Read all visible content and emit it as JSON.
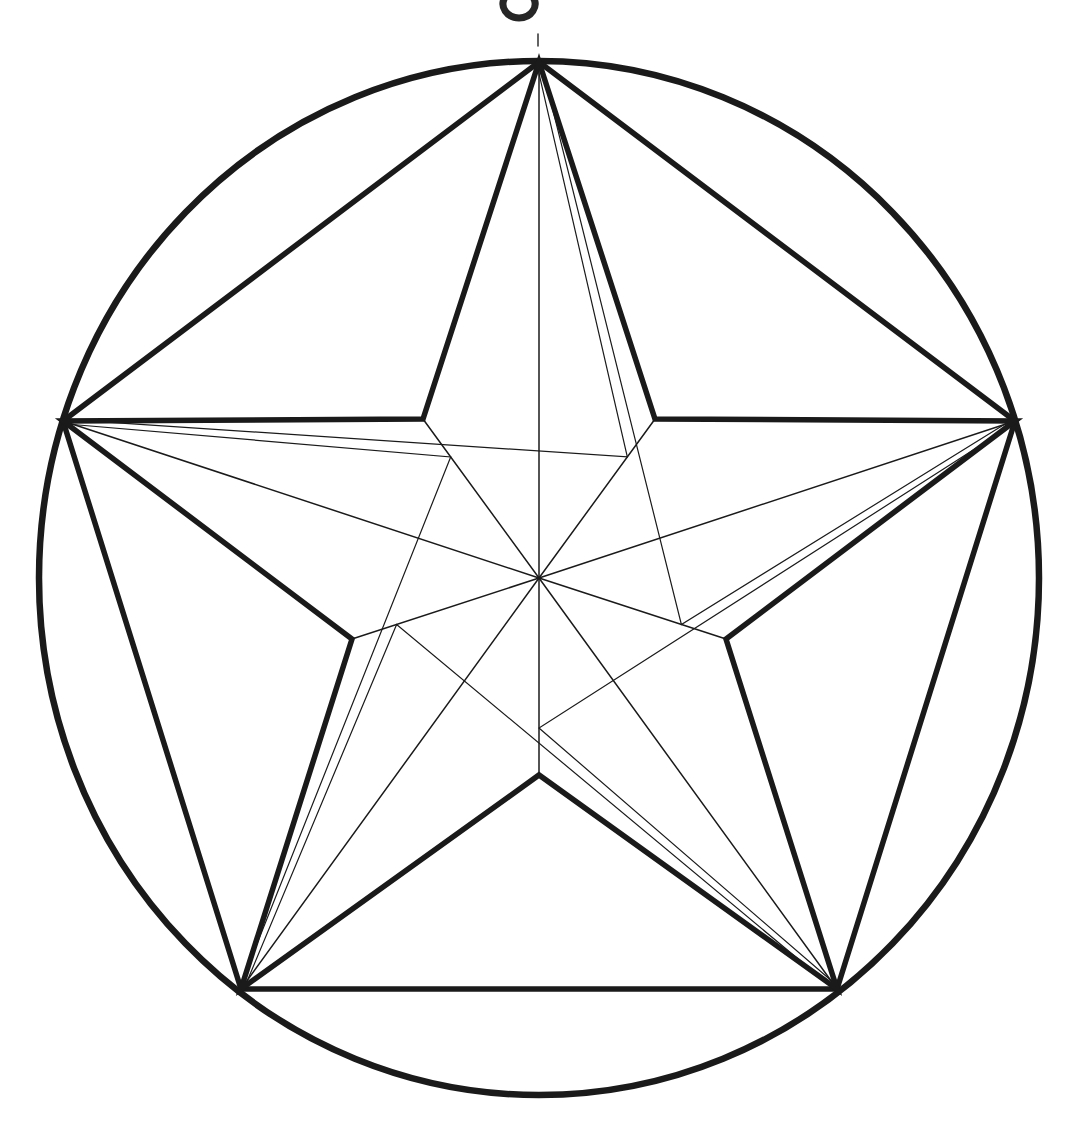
{
  "figure": {
    "title": "Pentagram inscribed in a circle",
    "background_color": "#ffffff",
    "ink_color": "#1a1a1a",
    "stroke_widths": {
      "circle": 6.5,
      "bold": 5.5,
      "thin": 1.5,
      "hairline": 1.2
    },
    "canvas": {
      "width": 1086,
      "height": 1141
    }
  },
  "chart_data": {
    "type": "scatter",
    "title": "Pentagram inscribed in a circle",
    "xlabel": "",
    "ylabel": "",
    "xlim": [
      0,
      1086
    ],
    "ylim": [
      0,
      1141
    ],
    "grid": false,
    "legend": "none",
    "geometry": {
      "center": {
        "x": 539,
        "y": 578
      },
      "circle_radius_x": 500,
      "circle_radius_y": 517,
      "outer_radius": 508,
      "inner_radius": 197,
      "inset_radius": 150,
      "inset_outer_factor": 0.88,
      "point_count": 5,
      "start_angle_deg": -90,
      "step_angle_deg": 72
    },
    "outer_points": [
      {
        "name": "top-apex",
        "angle_deg": -90,
        "x": 539,
        "y": 62
      },
      {
        "name": "right-point",
        "angle_deg": -18,
        "x": 1015,
        "y": 421
      },
      {
        "name": "bottom-right-point",
        "angle_deg": 54,
        "x": 837,
        "y": 989
      },
      {
        "name": "bottom-left-point",
        "angle_deg": 126,
        "x": 241,
        "y": 989
      },
      {
        "name": "left-point",
        "angle_deg": 198,
        "x": 63,
        "y": 421
      }
    ],
    "inner_points": [
      {
        "name": "inner-upper-right",
        "angle_deg": -54,
        "x": 655,
        "y": 419
      },
      {
        "name": "inner-right",
        "angle_deg": 18,
        "x": 726,
        "y": 639
      },
      {
        "name": "inner-bottom",
        "angle_deg": 90,
        "x": 539,
        "y": 775
      },
      {
        "name": "inner-left",
        "angle_deg": 162,
        "x": 352,
        "y": 639
      },
      {
        "name": "inner-upper-left",
        "angle_deg": -126,
        "x": 423,
        "y": 419
      }
    ],
    "elements": [
      {
        "id": "circle",
        "kind": "circle",
        "weight": "bold",
        "count": 1
      },
      {
        "id": "pentagon-chords",
        "kind": "polygon",
        "weight": "bold",
        "count": 5
      },
      {
        "id": "star-outline",
        "kind": "polygon",
        "weight": "bold",
        "count": 10
      },
      {
        "id": "radial-lines",
        "kind": "lines",
        "weight": "thin",
        "count": 10
      },
      {
        "id": "inset-chevrons",
        "kind": "lines",
        "weight": "thin",
        "count": 5
      },
      {
        "id": "apex-tick",
        "kind": "mark",
        "weight": "thin",
        "count": 1
      },
      {
        "id": "top-edge-blot",
        "kind": "mark",
        "weight": "bold",
        "count": 1
      }
    ]
  }
}
